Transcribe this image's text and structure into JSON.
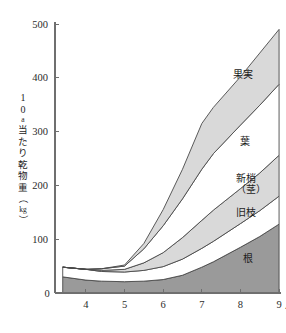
{
  "chart_data": {
    "type": "area",
    "title": "",
    "subtitle": "",
    "xlabel": "月",
    "ylabel": "10a当たり乾物重（kg）",
    "ylabel_parts": [
      "1",
      "0",
      "a",
      "当",
      "た",
      "り",
      "乾",
      "物",
      "重",
      "（",
      "kg",
      "）"
    ],
    "x_unit_suffix": "月",
    "x": [
      3.4,
      4.0,
      4.4,
      5.0,
      5.5,
      6.0,
      6.5,
      7.0,
      7.3,
      8.0,
      8.5,
      9.0
    ],
    "xlim": [
      3.2,
      9.05
    ],
    "ylim": [
      0,
      500
    ],
    "x_ticks": [
      4,
      5,
      6,
      7,
      8,
      9
    ],
    "x_tick_labels": [
      "4",
      "5",
      "6",
      "7",
      "8",
      "9"
    ],
    "y_ticks": [
      0,
      100,
      200,
      300,
      400,
      500
    ],
    "y_tick_labels": [
      "0",
      "100",
      "200",
      "300",
      "400",
      "500"
    ],
    "grid": false,
    "legend_position": "inline-right",
    "stacked": true,
    "series": [
      {
        "name": "根",
        "label": "根",
        "color": "#9a9a9a",
        "values": [
          30,
          24,
          22,
          21,
          22,
          25,
          33,
          48,
          58,
          85,
          105,
          128
        ]
      },
      {
        "name": "旧枝",
        "label": "旧枝",
        "color": "#ffffff",
        "values": [
          18,
          20,
          18,
          18,
          20,
          24,
          30,
          35,
          38,
          44,
          48,
          52
        ]
      },
      {
        "name": "新梢（茎）",
        "label": "新梢\n（茎）",
        "color": "#d9d9d9",
        "values": [
          0,
          0,
          2,
          5,
          14,
          26,
          40,
          52,
          58,
          65,
          70,
          76
        ]
      },
      {
        "name": "葉",
        "label": "葉",
        "color": "#ffffff",
        "values": [
          0,
          0,
          3,
          6,
          26,
          50,
          72,
          95,
          105,
          118,
          126,
          132
        ]
      },
      {
        "name": "果実",
        "label": "果実",
        "color": "#d9d9d9",
        "values": [
          0,
          0,
          0,
          2,
          10,
          30,
          55,
          85,
          86,
          90,
          97,
          102
        ]
      }
    ],
    "series_totals_note": "stacked cumulative top reaches ~490 at month 9"
  },
  "axes": {
    "zero_label": "0",
    "y_axis_name": "y-axis",
    "x_axis_name": "x-axis"
  }
}
